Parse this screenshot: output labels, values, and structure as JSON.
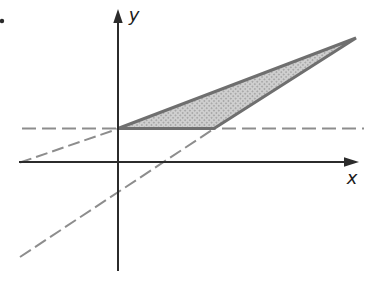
{
  "figure": {
    "canvas": {
      "width": 369,
      "height": 283,
      "background": "#ffffff"
    },
    "axis_labels": {
      "x": "x",
      "y": "y"
    },
    "colors": {
      "axis": "#2b2b2b",
      "label": "#1c1c1c",
      "dashed": "#8d8d8d",
      "triangle_stroke": "#6f6f6f",
      "triangle_fill_base": "#cfcfcf",
      "triangle_fill_dot": "#9c9c9c"
    },
    "axes": {
      "x": {
        "line": [
          19,
          162,
          346,
          162
        ],
        "arrow": [
          [
            359,
            162
          ],
          [
            344,
            157.3
          ],
          [
            344,
            166.7
          ]
        ]
      },
      "y": {
        "line": [
          118,
          271,
          118,
          22
        ],
        "arrow": [
          [
            118,
            9
          ],
          [
            113.3,
            23
          ],
          [
            122.7,
            23
          ]
        ]
      }
    },
    "dashed_lines": [
      {
        "name": "horizontal-dashed-line",
        "x1": 22,
        "y1": 128.5,
        "x2": 364,
        "y2": 128.5,
        "dash": "14 6"
      },
      {
        "name": "shallow-diagonal-dashed-line",
        "x1": 20,
        "y1": 162.5,
        "x2": 117.5,
        "y2": 129,
        "dash": "12 5"
      },
      {
        "name": "steep-diagonal-dashed-line",
        "x1": 20,
        "y1": 257,
        "x2": 213.5,
        "y2": 129,
        "dash": "13 5"
      }
    ],
    "triangle": {
      "name": "shaded-triangle",
      "points": [
        [
          118,
          128.5
        ],
        [
          214,
          128.5
        ],
        [
          356,
          38
        ]
      ]
    },
    "marker_dot": {
      "cx": 2,
      "cy": 21,
      "r": 2.2
    }
  }
}
